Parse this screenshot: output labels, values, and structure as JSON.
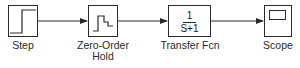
{
  "diagram": {
    "type": "simulink-model",
    "colors": {
      "stroke": "#2a2a2a",
      "background": "#ffffff"
    },
    "blocks": [
      {
        "id": "step",
        "label_lines": [
          "Step"
        ],
        "icon": "step-signal-icon"
      },
      {
        "id": "zoh",
        "label_lines": [
          "Zero-Order",
          "Hold"
        ],
        "icon": "staircase-signal-icon"
      },
      {
        "id": "tf",
        "label_lines": [
          "Transfer Fcn"
        ],
        "numerator": "1",
        "denominator": "S+1"
      },
      {
        "id": "scope",
        "label_lines": [
          "Scope"
        ],
        "icon": "scope-screen-icon"
      }
    ],
    "connections": [
      {
        "from": "Step",
        "to": "Zero-Order Hold"
      },
      {
        "from": "Zero-Order Hold",
        "to": "Transfer Fcn"
      },
      {
        "from": "Transfer Fcn",
        "to": "Scope"
      }
    ]
  }
}
